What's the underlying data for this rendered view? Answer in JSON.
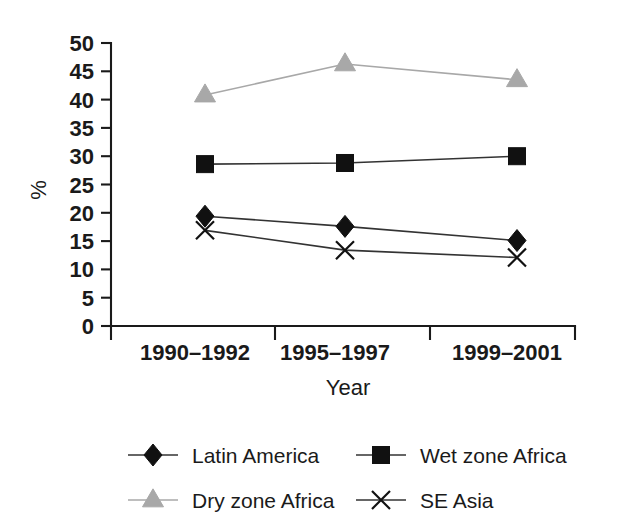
{
  "chart_data": {
    "type": "line",
    "title": "",
    "xlabel": "Year",
    "ylabel": "%",
    "categories": [
      "1990–1992",
      "1995–1997",
      "1999–2001"
    ],
    "ylim": [
      0,
      50
    ],
    "yticks": [
      0,
      5,
      10,
      15,
      20,
      25,
      30,
      35,
      40,
      45,
      50
    ],
    "ytick_labels": [
      "0",
      "5",
      "10",
      "15",
      "20",
      "25",
      "30",
      "35",
      "40",
      "45",
      "50"
    ],
    "grid": false,
    "legend_position": "bottom",
    "series": [
      {
        "name": "Latin America",
        "marker": "diamond",
        "color": "#111111",
        "line_color": "#333333",
        "values": [
          19.4,
          17.6,
          15.1
        ]
      },
      {
        "name": "Wet zone Africa",
        "marker": "square",
        "color": "#111111",
        "line_color": "#333333",
        "values": [
          28.6,
          28.8,
          30.0
        ]
      },
      {
        "name": "Dry zone Africa",
        "marker": "triangle",
        "color": "#a8a8a8",
        "line_color": "#a8a8a8",
        "values": [
          40.8,
          46.3,
          43.5
        ]
      },
      {
        "name": "SE Asia",
        "marker": "cross",
        "color": "#111111",
        "line_color": "#333333",
        "values": [
          16.9,
          13.4,
          12.1
        ]
      }
    ]
  },
  "legend": {
    "entries": [
      {
        "label": "Latin America"
      },
      {
        "label": "Wet zone Africa"
      },
      {
        "label": "Dry zone Africa"
      },
      {
        "label": "SE Asia"
      }
    ]
  },
  "axes": {
    "y_axis_label": "%",
    "x_axis_label": "Year"
  }
}
